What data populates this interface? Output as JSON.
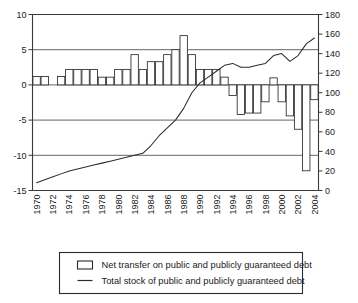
{
  "chart_data": {
    "type": "bar",
    "title": "",
    "subtitle": "",
    "xlabel": "",
    "ylabel": "",
    "grid": true,
    "legend_position": "bottom",
    "x": [
      1970,
      1971,
      1972,
      1973,
      1974,
      1975,
      1976,
      1977,
      1978,
      1979,
      1980,
      1981,
      1982,
      1983,
      1984,
      1985,
      1986,
      1987,
      1988,
      1989,
      1990,
      1991,
      1992,
      1993,
      1994,
      1995,
      1996,
      1997,
      1998,
      1999,
      2000,
      2001,
      2002,
      2003,
      2004
    ],
    "categories": [
      "1970",
      "1971",
      "1972",
      "1973",
      "1974",
      "1975",
      "1976",
      "1977",
      "1978",
      "1979",
      "1980",
      "1981",
      "1982",
      "1983",
      "1984",
      "1985",
      "1986",
      "1987",
      "1988",
      "1989",
      "1990",
      "1991",
      "1992",
      "1993",
      "1994",
      "1995",
      "1996",
      "1997",
      "1998",
      "1999",
      "2000",
      "2001",
      "2002",
      "2003",
      "2004"
    ],
    "tick_labels_x": [
      "1970",
      "1972",
      "1974",
      "1976",
      "1978",
      "1980",
      "1982",
      "1984",
      "1986",
      "1988",
      "1990",
      "1992",
      "1994",
      "1996",
      "1998",
      "2000",
      "2002",
      "2004"
    ],
    "left_axis": {
      "name": "Net transfer on public and publicly guaranteed debt",
      "ticks": [
        10,
        5,
        0,
        -5,
        -10,
        -15
      ],
      "tick_labels": [
        "10",
        "5",
        "0",
        "-5",
        "-10",
        "-15"
      ],
      "ylim": [
        -15,
        10
      ]
    },
    "right_axis": {
      "name": "Total stock of public and publicly guaranteed debt",
      "ticks": [
        180,
        160,
        140,
        120,
        100,
        80,
        60,
        40,
        20,
        0
      ],
      "tick_labels": [
        "180",
        "160",
        "140",
        "120",
        "100",
        "80",
        "60",
        "40",
        "20",
        "0"
      ],
      "ylim": [
        0,
        180
      ]
    },
    "series": [
      {
        "name": "Net transfer on public and publicly guaranteed debt",
        "type": "bar",
        "axis": "left",
        "values": [
          1.2,
          1.2,
          0.0,
          1.2,
          2.2,
          2.2,
          2.2,
          2.2,
          1.1,
          1.1,
          2.2,
          2.2,
          4.3,
          2.2,
          3.3,
          3.3,
          4.3,
          5.0,
          7.0,
          4.3,
          2.2,
          2.2,
          2.2,
          1.1,
          -1.5,
          -4.2,
          -4.0,
          -4.0,
          -2.4,
          1.0,
          -2.4,
          -4.4,
          -6.3,
          -12.2,
          -2.1
        ]
      },
      {
        "name": "Total stock of public and publicly guaranteed debt",
        "type": "line",
        "axis": "right",
        "values": [
          8,
          11,
          14,
          17,
          20,
          22,
          24,
          26,
          28,
          30,
          32,
          34,
          36,
          38,
          46,
          56,
          64,
          72,
          84,
          100,
          110,
          116,
          122,
          128,
          130,
          126,
          126,
          128,
          130,
          138,
          140,
          132,
          138,
          150,
          156
        ]
      }
    ]
  },
  "legend": {
    "items": [
      {
        "marker": "bar-swatch",
        "label": "Net transfer on public and publicly guaranteed debt"
      },
      {
        "marker": "line-swatch",
        "label": "Total stock of public and publicly guaranteed debt"
      }
    ]
  }
}
